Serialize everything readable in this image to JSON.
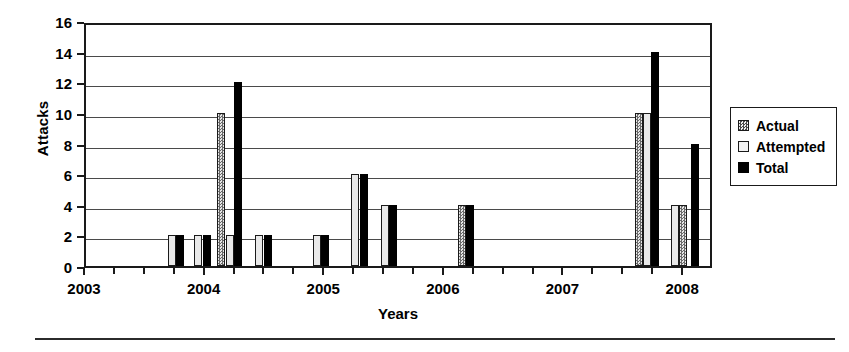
{
  "chart_data": {
    "type": "bar",
    "title": "",
    "xlabel": "Years",
    "ylabel": "Attacks",
    "ylim": [
      0,
      16
    ],
    "ytick_step": 2,
    "yticks": [
      0,
      2,
      4,
      6,
      8,
      10,
      12,
      14,
      16
    ],
    "xlim": [
      2003,
      2008.25
    ],
    "xticks_major": [
      2003,
      2004,
      2005,
      2006,
      2007,
      2008
    ],
    "xticklabels": [
      "2003",
      "2004",
      "2005",
      "2006",
      "2007",
      "2008"
    ],
    "xticks_minor_per_year": 4,
    "grid": "horizontal",
    "legend_position": "right-outside",
    "series": [
      {
        "name": "Actual",
        "pattern": "dotted-checker",
        "color": "#8c8c8c"
      },
      {
        "name": "Attempted",
        "pattern": "solid-light",
        "color": "#e9e9e9"
      },
      {
        "name": "Total",
        "pattern": "solid-black",
        "color": "#000000"
      }
    ],
    "bars": [
      {
        "x": 2003.72,
        "series": "Attempted",
        "value": 2
      },
      {
        "x": 2003.79,
        "series": "Total",
        "value": 2
      },
      {
        "x": 2003.94,
        "series": "Attempted",
        "value": 2
      },
      {
        "x": 2004.01,
        "series": "Total",
        "value": 2
      },
      {
        "x": 2004.13,
        "series": "Actual",
        "value": 10
      },
      {
        "x": 2004.2,
        "series": "Attempted",
        "value": 2
      },
      {
        "x": 2004.27,
        "series": "Total",
        "value": 12
      },
      {
        "x": 2004.45,
        "series": "Attempted",
        "value": 2
      },
      {
        "x": 2004.52,
        "series": "Total",
        "value": 2
      },
      {
        "x": 2004.93,
        "series": "Attempted",
        "value": 2
      },
      {
        "x": 2005.0,
        "series": "Total",
        "value": 2
      },
      {
        "x": 2005.25,
        "series": "Attempted",
        "value": 6
      },
      {
        "x": 2005.32,
        "series": "Total",
        "value": 6
      },
      {
        "x": 2005.5,
        "series": "Attempted",
        "value": 4
      },
      {
        "x": 2005.57,
        "series": "Total",
        "value": 4
      },
      {
        "x": 2006.14,
        "series": "Actual",
        "value": 4
      },
      {
        "x": 2006.21,
        "series": "Total",
        "value": 4
      },
      {
        "x": 2007.62,
        "series": "Actual",
        "value": 10
      },
      {
        "x": 2007.69,
        "series": "Attempted",
        "value": 10
      },
      {
        "x": 2007.76,
        "series": "Total",
        "value": 14
      },
      {
        "x": 2007.92,
        "series": "Attempted",
        "value": 4
      },
      {
        "x": 2007.99,
        "series": "Actual",
        "value": 4
      },
      {
        "x": 2008.09,
        "series": "Total",
        "value": 8
      }
    ]
  },
  "legend": {
    "items": [
      {
        "label": "Actual"
      },
      {
        "label": "Attempted"
      },
      {
        "label": "Total"
      }
    ]
  },
  "axes": {
    "y_title": "Attacks",
    "x_title": "Years"
  }
}
